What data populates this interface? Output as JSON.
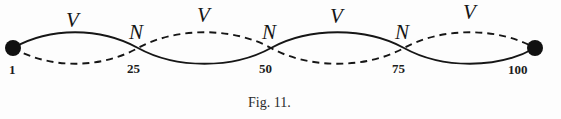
{
  "figure": {
    "caption": "Fig. 11.",
    "background_color": "#fdfdfd",
    "ink_color": "#161616",
    "width": 561,
    "height": 119
  },
  "axis": {
    "baseline_y": 48,
    "start_x": 13,
    "end_x": 535
  },
  "endpoints": [
    {
      "name": "left-endpoint",
      "label": "1",
      "x": 13,
      "y": 48,
      "label_x": 9,
      "label_y": 63,
      "marker": "filled-circle",
      "radius": 8
    },
    {
      "name": "right-endpoint",
      "label": "100",
      "x": 535,
      "y": 48,
      "label_x": 508,
      "label_y": 63,
      "marker": "filled-circle",
      "radius": 8
    }
  ],
  "nodes": [
    {
      "name": "node-25",
      "letter": "N",
      "number": "25",
      "x": 138,
      "letter_x": 129,
      "letter_y": 22,
      "number_x": 127,
      "number_y": 62
    },
    {
      "name": "node-50",
      "letter": "N",
      "number": "50",
      "x": 271,
      "letter_x": 262,
      "letter_y": 22,
      "number_x": 259,
      "number_y": 62
    },
    {
      "name": "node-75",
      "letter": "N",
      "number": "75",
      "x": 404,
      "letter_x": 395,
      "letter_y": 22,
      "number_x": 392,
      "number_y": 62
    }
  ],
  "antinodes": [
    {
      "name": "antinode-1",
      "letter": "V",
      "x": 75,
      "letter_x": 66,
      "letter_y": 10,
      "loop_phase": "solid-up"
    },
    {
      "name": "antinode-2",
      "letter": "V",
      "x": 205,
      "letter_x": 197,
      "letter_y": 5,
      "loop_phase": "dashed-up"
    },
    {
      "name": "antinode-3",
      "letter": "V",
      "x": 338,
      "letter_x": 330,
      "letter_y": 6,
      "loop_phase": "solid-up"
    },
    {
      "name": "antinode-4",
      "letter": "V",
      "x": 470,
      "letter_x": 463,
      "letter_y": 2,
      "loop_phase": "dashed-up"
    }
  ],
  "curves": {
    "solid": {
      "name": "solid-wave",
      "style": "solid",
      "stroke_width": 1.9,
      "color": "#161616",
      "path": "M13,48 C 50,27 100,27 138,48 C 176,69 233,69 271,48 C 309,27 366,27 404,48 C 442,69 498,69 535,48"
    },
    "dashed": {
      "name": "dashed-wave",
      "style": "dashed",
      "stroke_width": 1.9,
      "color": "#161616",
      "dash_pattern": "7 5",
      "path": "M13,48 C 50,69 100,69 138,48 C 176,27 233,27 271,48 C 309,69 366,69 404,48 C 442,27 498,27 535,48"
    }
  },
  "caption_position": {
    "x": 248,
    "y": 96
  }
}
